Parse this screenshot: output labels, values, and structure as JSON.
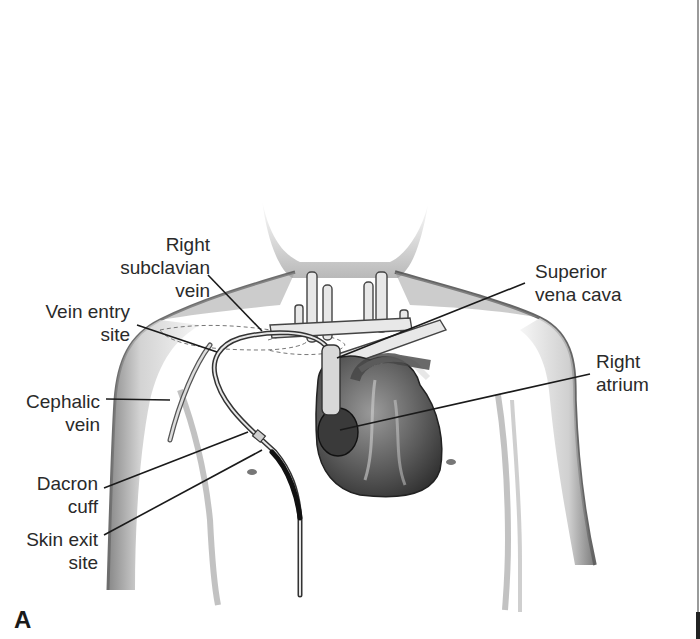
{
  "figure": {
    "panel_letter": "A",
    "colors": {
      "background": "#ffffff",
      "ink": "#2a2a2a",
      "shading": "#8a8a8a",
      "edge_line": "#9a9a9a"
    }
  },
  "labels": {
    "right_subclavian_vein": {
      "line1": "Right",
      "line2": "subclavian",
      "line3": "vein"
    },
    "vein_entry_site": {
      "line1": "Vein entry",
      "line2": "site"
    },
    "cephalic_vein": {
      "line1": "Cephalic",
      "line2": "vein"
    },
    "dacron_cuff": {
      "line1": "Dacron",
      "line2": "cuff"
    },
    "skin_exit_site": {
      "line1": "Skin exit",
      "line2": "site"
    },
    "superior_vena_cava": {
      "line1": "Superior",
      "line2": "vena cava"
    },
    "right_atrium": {
      "line1": "Right",
      "line2": "atrium"
    }
  }
}
